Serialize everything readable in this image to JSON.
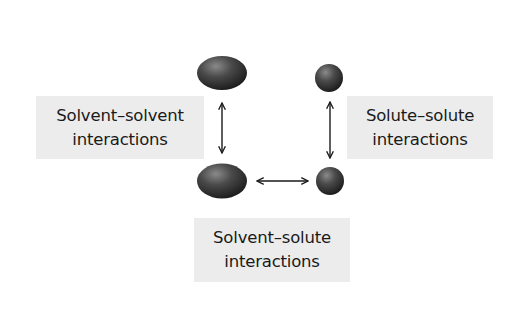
{
  "diagram": {
    "particles": [
      {
        "id": "solvent-top",
        "kind": "solvent",
        "shape": "ellipse",
        "cx": 222,
        "cy": 73,
        "rx": 25,
        "ry": 17
      },
      {
        "id": "solute-top",
        "kind": "solute",
        "shape": "sphere",
        "cx": 329,
        "cy": 78,
        "r": 14
      },
      {
        "id": "solvent-bottom",
        "kind": "solvent",
        "shape": "ellipse",
        "cx": 222,
        "cy": 181,
        "rx": 25,
        "ry": 17.5
      },
      {
        "id": "solute-bottom",
        "kind": "solute",
        "shape": "sphere",
        "cx": 330,
        "cy": 181,
        "r": 14
      }
    ],
    "arrows": [
      {
        "id": "solvent-solvent-arrow",
        "from": "solvent-top",
        "to": "solvent-bottom",
        "direction": "double",
        "orientation": "vertical"
      },
      {
        "id": "solute-solute-arrow",
        "from": "solute-top",
        "to": "solute-bottom",
        "direction": "double",
        "orientation": "vertical"
      },
      {
        "id": "solvent-solute-arrow",
        "from": "solvent-bottom",
        "to": "solute-bottom",
        "direction": "double",
        "orientation": "horizontal"
      }
    ],
    "labels": {
      "solvent_solvent": {
        "line1": "Solvent–solvent",
        "line2": "interactions"
      },
      "solute_solute": {
        "line1": "Solute–solute",
        "line2": "interactions"
      },
      "solvent_solute": {
        "line1": "Solvent–solute",
        "line2": "interactions"
      }
    },
    "colors": {
      "particle_dark": "#2a2a2a",
      "particle_mid": "#555555",
      "particle_highlight": "#8a8a8a",
      "label_background": "#ececec",
      "text": "#1a1a1a",
      "arrow": "#1a1a1a"
    }
  }
}
